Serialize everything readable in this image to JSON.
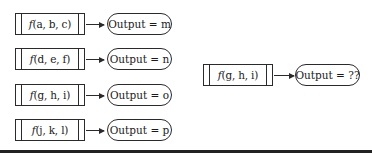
{
  "diagram": {
    "examples": [
      {
        "func_name": "f",
        "args": "(a, b, c)",
        "output": "Output = m"
      },
      {
        "func_name": "f",
        "args": "(d, e, f)",
        "output": "Output = n"
      },
      {
        "func_name": "f",
        "args": "(g, h, i)",
        "output": "Output = o"
      },
      {
        "func_name": "f",
        "args": "(j, k, l)",
        "output": "Output = p"
      }
    ],
    "query": {
      "func_name": "f",
      "args": "(g, h, i)",
      "output": "Output = ??"
    }
  }
}
